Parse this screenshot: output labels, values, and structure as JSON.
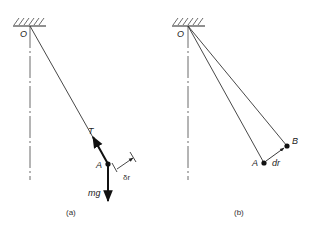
{
  "figure_a": {
    "pivot_label": "O",
    "mass_label": "A",
    "tension_label": "T",
    "weight_label": "mg",
    "displacement_label": "δr",
    "caption": "(a)"
  },
  "figure_b": {
    "pivot_label": "O",
    "point_a_label": "A",
    "point_b_label": "B",
    "displacement_label": "dr",
    "caption": "(b)"
  },
  "icons": {
    "ceiling_support": "hatched-ceiling",
    "point_mass": "filled-dot",
    "force_arrow": "arrow"
  }
}
